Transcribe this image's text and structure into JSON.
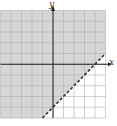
{
  "chart_data": {
    "type": "inequality-region",
    "title": "",
    "xlabel": "x",
    "ylabel": "y",
    "xlim": [
      -5,
      5
    ],
    "ylim": [
      -5,
      5
    ],
    "grid": true,
    "grid_step": 1,
    "boundary": {
      "equation": "y = x - 4",
      "slope": 1,
      "intercept": -4,
      "style": "dashed",
      "points": [
        [
          -1,
          -5
        ],
        [
          5,
          1
        ]
      ]
    },
    "inequality": "y > x - 4",
    "shaded_side": "above-left",
    "colors": {
      "shade": "#d6d6d6",
      "grid": "#b0b0b0",
      "axis": "#222222",
      "boundary": "#333333"
    }
  },
  "labels": {
    "x_axis": "x",
    "y_axis": "y"
  }
}
